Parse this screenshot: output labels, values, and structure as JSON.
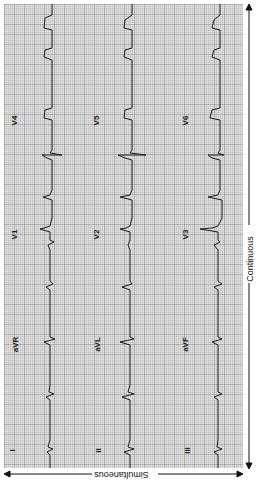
{
  "figure": {
    "type": "12-lead ECG (rotated)",
    "orientation": "strips run vertically, top-to-bottom is continuous time reversed"
  },
  "leads": {
    "col1": [
      "I",
      "aVR",
      "V1",
      "V4"
    ],
    "col2": [
      "II",
      "aVL",
      "V2",
      "V5"
    ],
    "col3": [
      "III",
      "aVF",
      "V3",
      "V6"
    ]
  },
  "labels": {
    "I": "I",
    "II": "II",
    "III": "III",
    "aVR": "aVR",
    "aVL": "aVL",
    "aVF": "aVF",
    "V1": "V1",
    "V2": "V2",
    "V3": "V3",
    "V4": "V4",
    "V5": "V5",
    "V6": "V6"
  },
  "axes": {
    "simultaneous": "Simultaneous",
    "continuous": "Continuous"
  },
  "colors": {
    "grid_bg": "#e6e6e6",
    "trace": "#1a1a1a",
    "text": "#222222"
  }
}
